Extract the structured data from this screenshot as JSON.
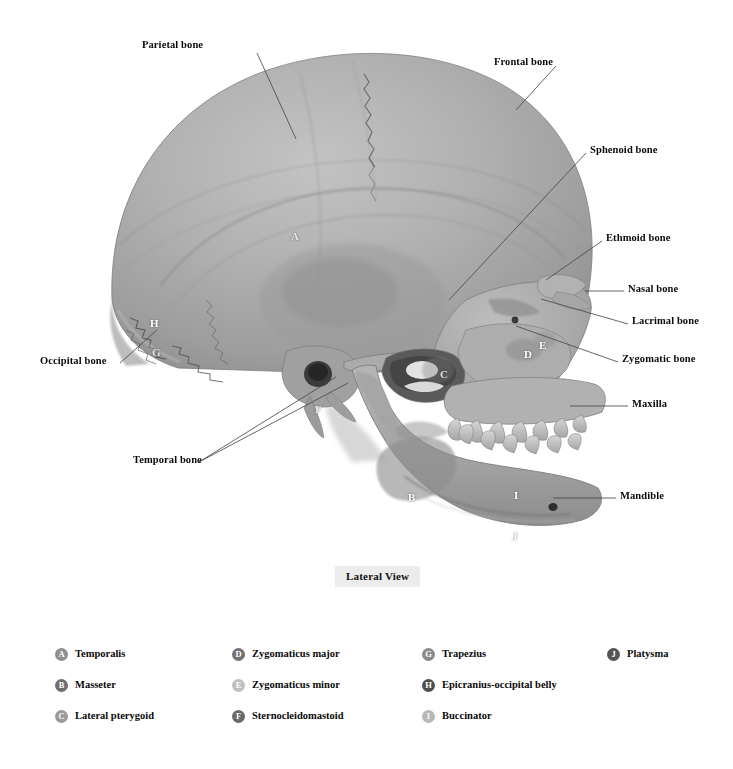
{
  "figure": {
    "view_caption": "Lateral View",
    "background_color": "#ffffff",
    "bone_color": "#a9a9a9",
    "label_color": "#0a0a0a",
    "leader_color": "#4a4a4a"
  },
  "bone_labels": [
    {
      "text": "Parietal bone",
      "side": "left",
      "x": 186,
      "y": 45,
      "lx": 257,
      "ly": 53,
      "tx": 296,
      "ty": 139
    },
    {
      "text": "Frontal bone",
      "side": "left",
      "x": 499,
      "y": 58,
      "lx": 556,
      "ly": 66,
      "tx": 516,
      "ty": 110
    },
    {
      "text": "Sphenoid bone",
      "side": "right",
      "x": 590,
      "y": 145,
      "lx": 586,
      "ly": 153,
      "tx": 449,
      "ty": 300
    },
    {
      "text": "Ethmoid bone",
      "side": "right",
      "x": 606,
      "y": 233,
      "lx": 602,
      "ly": 241,
      "tx": 546,
      "ty": 280
    },
    {
      "text": "Nasal bone",
      "side": "right",
      "x": 628,
      "y": 283,
      "lx": 624,
      "ly": 291,
      "tx": 585,
      "ty": 291
    },
    {
      "text": "Lacrimal bone",
      "side": "right",
      "x": 632,
      "y": 317,
      "lx": 628,
      "ly": 324,
      "tx": 541,
      "ty": 299
    },
    {
      "text": "Zygomatic bone",
      "side": "right",
      "x": 622,
      "y": 355,
      "lx": 618,
      "ly": 362,
      "tx": 516,
      "ty": 326
    },
    {
      "text": "Maxilla",
      "side": "right",
      "x": 632,
      "y": 399,
      "lx": 628,
      "ly": 406,
      "tx": 570,
      "ty": 406
    },
    {
      "text": "Mandible",
      "side": "right",
      "x": 620,
      "y": 491,
      "lx": 616,
      "ly": 498,
      "tx": 553,
      "ty": 498
    },
    {
      "text": "Occipital bone",
      "side": "left",
      "x": 40,
      "y": 356,
      "lx": 120,
      "ly": 363,
      "tx": 157,
      "ty": 330
    },
    {
      "text": "Temporal bone",
      "side": "left",
      "x": 133,
      "y": 455,
      "lx": 199,
      "ly": 462,
      "tx": 348,
      "ty": 383
    }
  ],
  "temporal_second_leader": {
    "fx": 199,
    "fy": 462,
    "tx": 336,
    "ty": 377
  },
  "muscle_markers": [
    {
      "letter": "A",
      "x": 291,
      "y": 231,
      "dim": true
    },
    {
      "letter": "B",
      "x": 408,
      "y": 492,
      "dim": false
    },
    {
      "letter": "C",
      "x": 440,
      "y": 369,
      "dim": true
    },
    {
      "letter": "D",
      "x": 524,
      "y": 349,
      "dim": false
    },
    {
      "letter": "E",
      "x": 539,
      "y": 340,
      "dim": false
    },
    {
      "letter": "F",
      "x": 315,
      "y": 404,
      "dim": true
    },
    {
      "letter": "G",
      "x": 152,
      "y": 347,
      "dim": true
    },
    {
      "letter": "H",
      "x": 150,
      "y": 318,
      "dim": false
    },
    {
      "letter": "I",
      "x": 514,
      "y": 490,
      "dim": false
    },
    {
      "letter": "J",
      "x": 512,
      "y": 531,
      "dim": false
    }
  ],
  "legend": {
    "columns": [
      [
        {
          "key": "A",
          "label": "Temporalis",
          "badge_color": "#8f8f8f"
        },
        {
          "key": "B",
          "label": "Masseter",
          "badge_color": "#6f6f6f"
        },
        {
          "key": "C",
          "label": "Lateral pterygoid",
          "badge_color": "#9a9a9a"
        }
      ],
      [
        {
          "key": "D",
          "label": "Zygomaticus major",
          "badge_color": "#727272"
        },
        {
          "key": "E",
          "label": "Zygomaticus minor",
          "badge_color": "#bfbfbf"
        },
        {
          "key": "F",
          "label": "Sternocleidomastoid",
          "badge_color": "#6a6a6a"
        }
      ],
      [
        {
          "key": "G",
          "label": "Trapezius",
          "badge_color": "#8a8a8a"
        },
        {
          "key": "H",
          "label": "Epicranius-occipital belly",
          "badge_color": "#4f4f4f"
        },
        {
          "key": "I",
          "label": "Buccinator",
          "badge_color": "#b8b8b8"
        }
      ],
      [
        {
          "key": "J",
          "label": "Platysma",
          "badge_color": "#555555"
        }
      ]
    ]
  }
}
